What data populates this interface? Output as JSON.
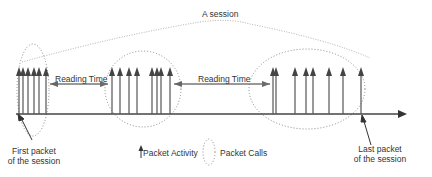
{
  "diagram": {
    "title": "A session",
    "reading_time_labels": [
      "Reading Time",
      "Reading Time"
    ],
    "first_packet_label": [
      "First packet",
      "of the session"
    ],
    "last_packet_label": [
      "Last packet",
      "of the session"
    ],
    "legend": {
      "packet_activity": "Packet Activity",
      "packet_calls": "Packet Calls"
    },
    "clusters": [
      {
        "name": "packet-call-1",
        "arrows_x": [
          19,
          23,
          28,
          34,
          39,
          46
        ]
      },
      {
        "name": "packet-call-2",
        "arrows_x": [
          112,
          120,
          129,
          137,
          152,
          157,
          161,
          170
        ]
      },
      {
        "name": "packet-call-3",
        "arrows_x": [
          273,
          276,
          295,
          306,
          313,
          329,
          343,
          361
        ]
      }
    ],
    "colors": {
      "line": "#444444",
      "dotted": "#888888",
      "text": "#333333"
    }
  }
}
